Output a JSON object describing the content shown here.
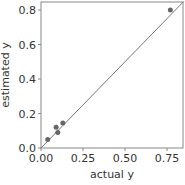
{
  "chart_data": {
    "type": "scatter",
    "title": "",
    "xlabel": "actual y",
    "ylabel": "estimated y",
    "xlim": [
      0,
      0.85
    ],
    "ylim": [
      0,
      0.85
    ],
    "xticks": [
      "0.00",
      "0.25",
      "0.50",
      "0.75"
    ],
    "yticks": [
      "0.0",
      "0.2",
      "0.4",
      "0.6",
      "0.8"
    ],
    "grid": false,
    "series": [
      {
        "name": "points",
        "x": [
          0.04,
          0.09,
          0.1,
          0.13,
          0.77
        ],
        "y": [
          0.05,
          0.12,
          0.09,
          0.145,
          0.8
        ]
      }
    ],
    "reference_line": {
      "type": "identity",
      "label": "y = x"
    },
    "colors": {
      "points": "#666666",
      "line": "#777777",
      "frame": "#888888"
    }
  }
}
